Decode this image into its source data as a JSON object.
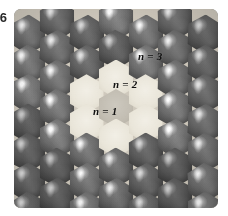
{
  "figure": {
    "number": "6",
    "caption_visible": false
  },
  "photo": {
    "description": "grayscale micrograph of a hexagonal close-packed bubble array",
    "border_radius_px": 7,
    "mortar_color": "#cfc9bd"
  },
  "colors": {
    "page_background": "#ffffff",
    "cell_dark": "#6e6e6e",
    "cell_light": "#eae6da",
    "cell_core": "#c3beb3",
    "label_text": "#111111"
  },
  "labels": [
    {
      "id": "n1",
      "text": "n = 1",
      "shell": 1,
      "on_dark": false,
      "x": 93,
      "y": 106
    },
    {
      "id": "n2",
      "text": "n = 2",
      "shell": 2,
      "on_dark": false,
      "x": 113,
      "y": 79
    },
    {
      "id": "n3",
      "text": "n = 3",
      "shell": 3,
      "on_dark": true,
      "x": 138,
      "y": 51
    }
  ],
  "lattice": {
    "orientation": "pointy-top",
    "cell_width_px": 34,
    "cell_height_px": 39,
    "column_step_x_px": 29.5,
    "row_step_y_px": 29.5,
    "columns": 7,
    "rows": 7,
    "shell_1_count": 1,
    "shell_2_count": 6,
    "cells": [
      {
        "col": -3,
        "row": -3,
        "shell": 4
      },
      {
        "col": -3,
        "row": -2,
        "shell": 4
      },
      {
        "col": -3,
        "row": -1,
        "shell": 3
      },
      {
        "col": -3,
        "row": 0,
        "shell": 3
      },
      {
        "col": -3,
        "row": 1,
        "shell": 3
      },
      {
        "col": -3,
        "row": 2,
        "shell": 4
      },
      {
        "col": -3,
        "row": 3,
        "shell": 4
      },
      {
        "col": -2,
        "row": -3,
        "shell": 4
      },
      {
        "col": -2,
        "row": -2,
        "shell": 3
      },
      {
        "col": -2,
        "row": -1,
        "shell": 3
      },
      {
        "col": -2,
        "row": 0,
        "shell": 3
      },
      {
        "col": -2,
        "row": 1,
        "shell": 3
      },
      {
        "col": -2,
        "row": 2,
        "shell": 3
      },
      {
        "col": -2,
        "row": 3,
        "shell": 4
      },
      {
        "col": -1,
        "row": -3,
        "shell": 4
      },
      {
        "col": -1,
        "row": -2,
        "shell": 3
      },
      {
        "col": -1,
        "row": -1,
        "shell": 2
      },
      {
        "col": -1,
        "row": 0,
        "shell": 2
      },
      {
        "col": -1,
        "row": 1,
        "shell": 3
      },
      {
        "col": -1,
        "row": 2,
        "shell": 3
      },
      {
        "col": -1,
        "row": 3,
        "shell": 4
      },
      {
        "col": 0,
        "row": -3,
        "shell": 4
      },
      {
        "col": 0,
        "row": -2,
        "shell": 3
      },
      {
        "col": 0,
        "row": -1,
        "shell": 2
      },
      {
        "col": 0,
        "row": 0,
        "shell": 1
      },
      {
        "col": 0,
        "row": 1,
        "shell": 2
      },
      {
        "col": 0,
        "row": 2,
        "shell": 3
      },
      {
        "col": 0,
        "row": 3,
        "shell": 4
      },
      {
        "col": 1,
        "row": -3,
        "shell": 4
      },
      {
        "col": 1,
        "row": -2,
        "shell": 3
      },
      {
        "col": 1,
        "row": -1,
        "shell": 2
      },
      {
        "col": 1,
        "row": 0,
        "shell": 2
      },
      {
        "col": 1,
        "row": 1,
        "shell": 3
      },
      {
        "col": 1,
        "row": 2,
        "shell": 3
      },
      {
        "col": 1,
        "row": 3,
        "shell": 4
      },
      {
        "col": 2,
        "row": -3,
        "shell": 4
      },
      {
        "col": 2,
        "row": -2,
        "shell": 3
      },
      {
        "col": 2,
        "row": -1,
        "shell": 3
      },
      {
        "col": 2,
        "row": 0,
        "shell": 3
      },
      {
        "col": 2,
        "row": 1,
        "shell": 3
      },
      {
        "col": 2,
        "row": 2,
        "shell": 3
      },
      {
        "col": 2,
        "row": 3,
        "shell": 4
      },
      {
        "col": 3,
        "row": -3,
        "shell": 4
      },
      {
        "col": 3,
        "row": -2,
        "shell": 4
      },
      {
        "col": 3,
        "row": -1,
        "shell": 3
      },
      {
        "col": 3,
        "row": 0,
        "shell": 3
      },
      {
        "col": 3,
        "row": 1,
        "shell": 3
      },
      {
        "col": 3,
        "row": 2,
        "shell": 4
      },
      {
        "col": 3,
        "row": 3,
        "shell": 4
      }
    ]
  }
}
